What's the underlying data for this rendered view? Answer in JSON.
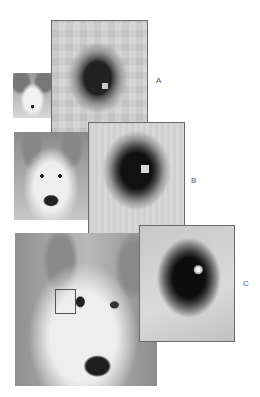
{
  "figure": {
    "labels": {
      "a": "A",
      "b": "B",
      "c": "C"
    },
    "photos": [
      {
        "id": "small",
        "content": "dog-face-photo"
      },
      {
        "id": "medium",
        "content": "dog-face-photo"
      },
      {
        "id": "large",
        "content": "dog-face-photo",
        "selection": "eye-region"
      }
    ],
    "zooms": [
      {
        "id": "A",
        "content": "pixelated-eye-coarse"
      },
      {
        "id": "B",
        "content": "pixelated-eye-medium"
      },
      {
        "id": "C",
        "content": "smooth-eye-fine"
      }
    ],
    "colors": {
      "frame": "#6a6a6a",
      "background": "#ffffff"
    }
  }
}
